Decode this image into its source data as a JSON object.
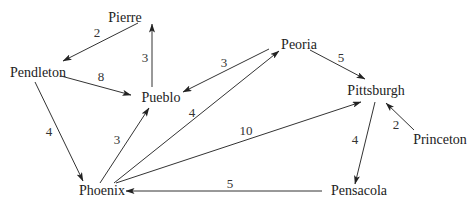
{
  "diagram": {
    "type": "directed-weighted-graph",
    "colors": {
      "line": "#333333",
      "text": "#222222",
      "background": "#ffffff"
    },
    "nodes": [
      {
        "id": "pierre",
        "label": "Pierre",
        "x": 125,
        "y": 22,
        "anchor": "middle"
      },
      {
        "id": "pendleton",
        "label": "Pendleton",
        "x": 38,
        "y": 77,
        "anchor": "middle"
      },
      {
        "id": "pueblo",
        "label": "Pueblo",
        "x": 161,
        "y": 102,
        "anchor": "middle"
      },
      {
        "id": "peoria",
        "label": "Peoria",
        "x": 299,
        "y": 49,
        "anchor": "middle"
      },
      {
        "id": "pittsburgh",
        "label": "Pittsburgh",
        "x": 376,
        "y": 95,
        "anchor": "middle"
      },
      {
        "id": "princeton",
        "label": "Princeton",
        "x": 440,
        "y": 144,
        "anchor": "middle"
      },
      {
        "id": "pensacola",
        "label": "Pensacola",
        "x": 359,
        "y": 195,
        "anchor": "middle"
      },
      {
        "id": "phoenix",
        "label": "Phoenix",
        "x": 102,
        "y": 195,
        "anchor": "middle"
      }
    ],
    "edges": [
      {
        "from": "pierre",
        "to": "pendleton",
        "weight": "2",
        "x1": 138,
        "y1": 23,
        "x2": 63,
        "y2": 61,
        "lx": 97,
        "ly": 37
      },
      {
        "from": "pendleton",
        "to": "pueblo",
        "weight": "8",
        "x1": 61,
        "y1": 76,
        "x2": 131,
        "y2": 95,
        "lx": 101,
        "ly": 81
      },
      {
        "from": "pueblo",
        "to": "pierre",
        "weight": "3",
        "x1": 152,
        "y1": 87,
        "x2": 152,
        "y2": 24,
        "lx": 145,
        "ly": 62
      },
      {
        "from": "peoria",
        "to": "pueblo",
        "weight": "3",
        "x1": 269,
        "y1": 49,
        "x2": 183,
        "y2": 92,
        "lx": 224,
        "ly": 67
      },
      {
        "from": "peoria",
        "to": "pittsburgh",
        "weight": "5",
        "x1": 310,
        "y1": 50,
        "x2": 365,
        "y2": 79,
        "lx": 341,
        "ly": 62
      },
      {
        "from": "pendleton",
        "to": "phoenix",
        "weight": "4",
        "x1": 35,
        "y1": 82,
        "x2": 83,
        "y2": 181,
        "lx": 49,
        "ly": 136
      },
      {
        "from": "phoenix",
        "to": "pueblo",
        "weight": "3",
        "x1": 100,
        "y1": 183,
        "x2": 149,
        "y2": 108,
        "lx": 117,
        "ly": 144
      },
      {
        "from": "phoenix",
        "to": "peoria",
        "weight": "4",
        "x1": 114,
        "y1": 183,
        "x2": 279,
        "y2": 51,
        "lx": 192,
        "ly": 117
      },
      {
        "from": "phoenix",
        "to": "pittsburgh",
        "weight": "10",
        "x1": 116,
        "y1": 183,
        "x2": 361,
        "y2": 102,
        "lx": 246,
        "ly": 135
      },
      {
        "from": "pittsburgh",
        "to": "pensacola",
        "weight": "4",
        "x1": 375,
        "y1": 102,
        "x2": 355,
        "y2": 184,
        "lx": 355,
        "ly": 144
      },
      {
        "from": "princeton",
        "to": "pittsburgh",
        "weight": "2",
        "x1": 414,
        "y1": 130,
        "x2": 386,
        "y2": 103,
        "lx": 396,
        "ly": 129
      },
      {
        "from": "pensacola",
        "to": "phoenix",
        "weight": "5",
        "x1": 322,
        "y1": 191,
        "x2": 126,
        "y2": 191,
        "lx": 230,
        "ly": 188
      }
    ]
  }
}
